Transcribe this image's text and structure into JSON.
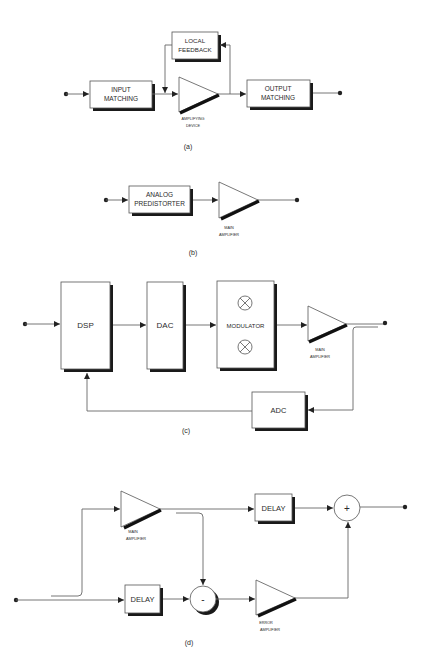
{
  "figure": {
    "panels": [
      {
        "id": "a",
        "caption": "(a)",
        "blocks": {
          "input_matching": [
            "INPUT",
            "MATCHING"
          ],
          "local_feedback": [
            "LOCAL",
            "FEEDBACK"
          ],
          "output_matching": [
            "OUTPUT",
            "MATCHING"
          ],
          "amplifier_label": [
            "AMPLIFYING",
            "DEVICE"
          ]
        }
      },
      {
        "id": "b",
        "caption": "(b)",
        "blocks": {
          "predistorter": [
            "ANALOG",
            "PREDISTORTER"
          ],
          "amplifier_label": [
            "MAIN",
            "AMPLIFIER"
          ]
        }
      },
      {
        "id": "c",
        "caption": "(c)",
        "blocks": {
          "dsp": "DSP",
          "dac": "DAC",
          "modulator": "MODULATOR",
          "mixer_symbol": "⊗",
          "adc": "ADC",
          "amplifier_label": [
            "MAIN",
            "AMPLIFIER"
          ]
        }
      },
      {
        "id": "d",
        "caption": "(d)",
        "blocks": {
          "delay_top": "DELAY",
          "delay_bottom": "DELAY",
          "summer": "+",
          "subtractor": "-",
          "main_amplifier_label": [
            "MAIN",
            "AMPLIFIER"
          ],
          "error_amplifier_label": [
            "ERROR",
            "AMPLIFIER"
          ]
        }
      }
    ]
  }
}
